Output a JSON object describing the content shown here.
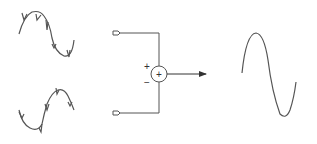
{
  "diagram": {
    "inputs": [
      {
        "name": "noisy-signal-a",
        "description": "Sine wave with noise spikes (starts rising)"
      },
      {
        "name": "noisy-signal-b",
        "description": "Inverted-phase sine with noise spikes"
      }
    ],
    "summer": {
      "label": "+",
      "top_input_sign": "+",
      "bottom_input_sign": "−"
    },
    "output": {
      "name": "clean-signal",
      "description": "Clean sine wave"
    },
    "colors": {
      "stroke": "#555555",
      "background": "#ffffff"
    }
  }
}
